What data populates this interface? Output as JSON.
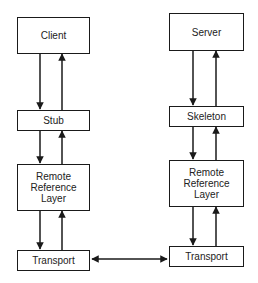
{
  "diagram": {
    "type": "layered architecture (RMI)",
    "client_stack": {
      "client": "Client",
      "stub": "Stub",
      "remote_reference_layer": "Remote\nReference\nLayer",
      "transport": "Transport"
    },
    "server_stack": {
      "server": "Server",
      "skeleton": "Skeleton",
      "remote_reference_layer": "Remote\nReference\nLayer",
      "transport": "Transport"
    },
    "connections": [
      {
        "from": "Client",
        "to": "Stub",
        "direction": "bidirectional (down and up arrows)"
      },
      {
        "from": "Stub",
        "to": "Remote Reference Layer (client)",
        "direction": "bidirectional (down and up arrows)"
      },
      {
        "from": "Remote Reference Layer (client)",
        "to": "Transport (client)",
        "direction": "bidirectional (down and up arrows)"
      },
      {
        "from": "Server",
        "to": "Skeleton",
        "direction": "bidirectional (down and up arrows)"
      },
      {
        "from": "Skeleton",
        "to": "Remote Reference Layer (server)",
        "direction": "bidirectional (down and up arrows)"
      },
      {
        "from": "Remote Reference Layer (server)",
        "to": "Transport (server)",
        "direction": "bidirectional (down and up arrows)"
      },
      {
        "from": "Transport (client)",
        "to": "Transport (server)",
        "direction": "double-headed arrow"
      }
    ],
    "colors": {
      "stroke": "#1a1a1a",
      "background": "#ffffff",
      "text": "#222222"
    }
  }
}
